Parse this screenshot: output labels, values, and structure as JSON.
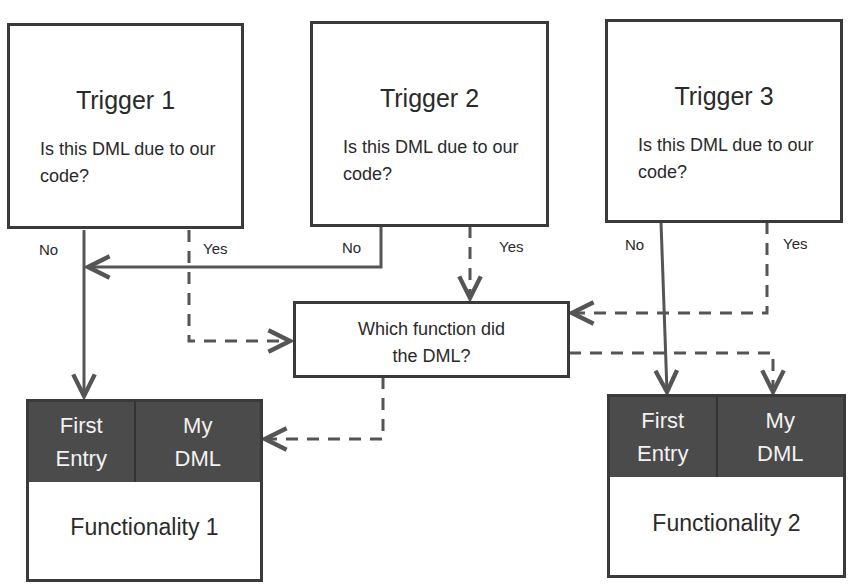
{
  "triggers": [
    {
      "title": "Trigger 1",
      "question": "Is this DML due to our code?",
      "no_label": "No",
      "yes_label": "Yes"
    },
    {
      "title": "Trigger 2",
      "question": "Is this DML due to our code?",
      "no_label": "No",
      "yes_label": "Yes"
    },
    {
      "title": "Trigger 3",
      "question": "Is this DML due to our code?",
      "no_label": "No",
      "yes_label": "Yes"
    }
  ],
  "decision": {
    "text": "Which function did the DML?"
  },
  "functionalities": [
    {
      "name": "Functionality 1",
      "cells": [
        "First Entry",
        "My DML"
      ]
    },
    {
      "name": "Functionality 2",
      "cells": [
        "First Entry",
        "My DML"
      ]
    }
  ],
  "colors": {
    "line": "#555555",
    "header": "#4b4b4b",
    "border": "#3a3a3a"
  }
}
